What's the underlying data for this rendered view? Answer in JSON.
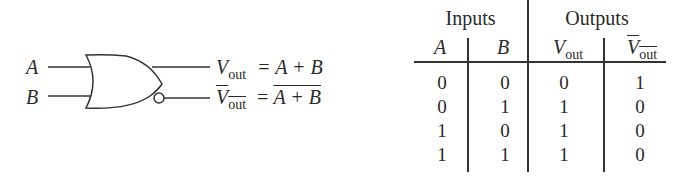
{
  "diagram": {
    "gate_type": "OR / NOR",
    "inputs": [
      "A",
      "B"
    ],
    "outputs": [
      {
        "symbol": "V",
        "subscript": "out",
        "complemented": false,
        "equation": "= A + B"
      },
      {
        "symbol": "V",
        "subscript": "out",
        "complemented": true,
        "equation": "= A + B",
        "equation_overlined": true
      }
    ]
  },
  "truth_table": {
    "group_headers": [
      "Inputs",
      "Outputs"
    ],
    "columns": [
      {
        "label": "A",
        "italic": true
      },
      {
        "label": "B",
        "italic": true
      },
      {
        "label": "V",
        "subscript": "out",
        "overline": false
      },
      {
        "label": "V",
        "subscript": "out",
        "overline": true
      }
    ],
    "rows": [
      [
        "0",
        "0",
        "0",
        "1"
      ],
      [
        "0",
        "1",
        "1",
        "0"
      ],
      [
        "1",
        "0",
        "1",
        "0"
      ],
      [
        "1",
        "1",
        "1",
        "0"
      ]
    ]
  },
  "colors": {
    "ink": "#2a2a2a",
    "background": "#ffffff"
  }
}
